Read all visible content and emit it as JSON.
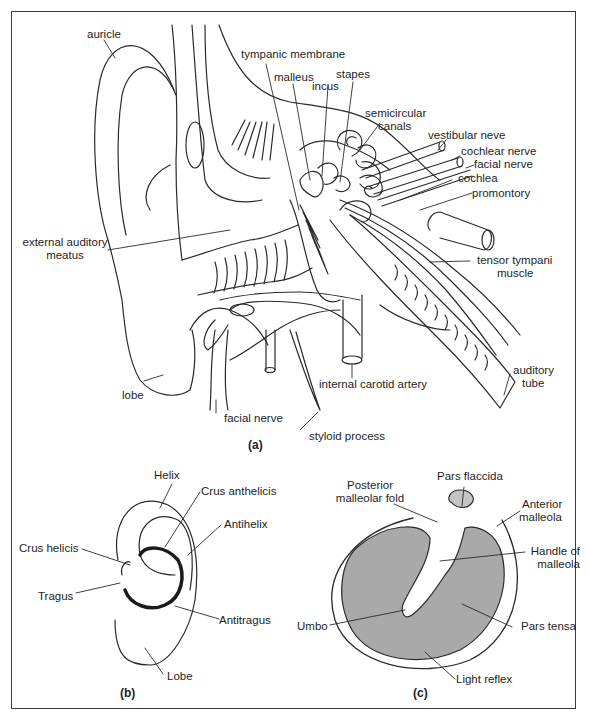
{
  "figure": {
    "panels": [
      {
        "id": "a",
        "caption": "(a)",
        "description": "Section through the ear: external, middle and inner ear",
        "labels": {
          "auricle": "auricle",
          "tympanic_membrane": "tympanic membrane",
          "malleus": "malleus",
          "incus": "incus",
          "stapes": "stapes",
          "semicircular_canals_1": "semicircular",
          "semicircular_canals_2": "canals",
          "vestibular_nerve": "vestibular neve",
          "cochlear_nerve": "cochlear nerve",
          "facial_nerve_upper": "facial nerve",
          "cochlea": "cochlea",
          "promontory": "promontory",
          "external_auditory_meatus_1": "external auditory",
          "external_auditory_meatus_2": "meatus",
          "tensor_tympani_1": "tensor tympani",
          "tensor_tympani_2": "muscle",
          "lobe": "lobe",
          "facial_nerve_lower": "facial nerve",
          "internal_carotid_artery": "internal carotid artery",
          "styloid_process": "styloid process",
          "auditory_tube_1": "auditory",
          "auditory_tube_2": "tube"
        }
      },
      {
        "id": "b",
        "caption": "(b)",
        "description": "Auricle (pinna) surface anatomy",
        "labels": {
          "helix": "Helix",
          "crus_anthelicis": "Crus anthelicis",
          "antihelix": "Antihelix",
          "crus_helicis": "Crus helicis",
          "tragus": "Tragus",
          "antitragus": "Antitragus",
          "lobe": "Lobe"
        }
      },
      {
        "id": "c",
        "caption": "(c)",
        "description": "Tympanic membrane (otoscopic view)",
        "labels": {
          "posterior_malleolar_fold_1": "Posterior",
          "posterior_malleolar_fold_2": "malleolar fold",
          "pars_flaccida": "Pars flaccida",
          "anterior_malleola_1": "Anterior",
          "anterior_malleola_2": "malleola",
          "handle_of_malleola_1": "Handle of",
          "handle_of_malleola_2": "malleola",
          "umbo": "Umbo",
          "pars_tensa": "Pars tensa",
          "light_reflex": "Light reflex"
        }
      }
    ],
    "colors": {
      "line": "#2a2a2a",
      "tympanic_fill": "#a9a9a9",
      "pars_flaccida_fill": "#c4c4c4",
      "background": "#ffffff"
    }
  }
}
